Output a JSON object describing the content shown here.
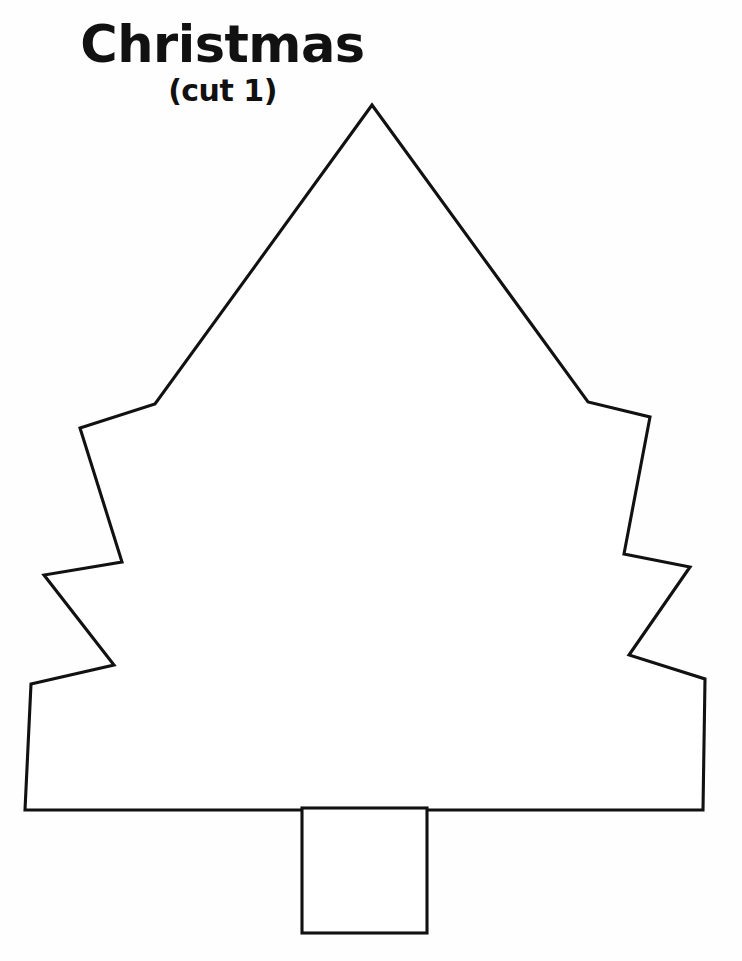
{
  "page": {
    "background_color": "#ffffff",
    "ink_color": "#111111",
    "width": 742,
    "height": 961,
    "kind": "printable craft template worksheet"
  },
  "title_block": {
    "title": "Christmas",
    "subtitle": "(cut 1)"
  },
  "artwork": {
    "name": "christmas-tree-outline",
    "description": "Black outline drawing of a Christmas tree with three pairs of zigzag branch notches and a square trunk",
    "stroke_color": "#111111",
    "fill_color": "#ffffff",
    "stroke_width": 3.1,
    "shapes": [
      {
        "name": "tree-body",
        "type": "polygon",
        "points": [
          [
            372,
            105
          ],
          [
            588,
            402
          ],
          [
            650,
            417
          ],
          [
            624,
            554
          ],
          [
            690,
            567
          ],
          [
            629,
            655
          ],
          [
            705,
            679
          ],
          [
            703,
            810
          ],
          [
            25,
            810
          ],
          [
            31,
            684
          ],
          [
            114,
            665
          ],
          [
            44,
            575
          ],
          [
            122,
            562
          ],
          [
            80,
            428
          ],
          [
            155,
            404
          ]
        ]
      },
      {
        "name": "tree-trunk",
        "type": "rect",
        "x": 302,
        "y": 808,
        "width": 125,
        "height": 125
      }
    ]
  }
}
